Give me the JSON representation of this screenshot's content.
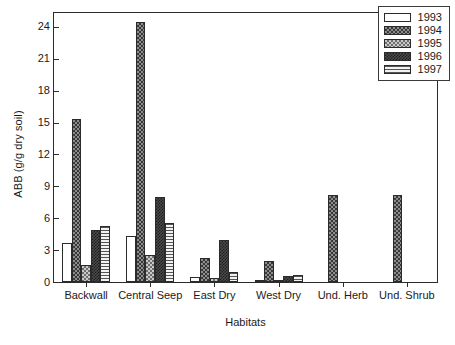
{
  "chart_data": {
    "type": "bar",
    "title": "",
    "xlabel": "Habitats",
    "ylabel": "ABB (g/g dry soil)",
    "categories": [
      "Backwall",
      "Central Seep",
      "East Dry",
      "West Dry",
      "Und. Herb",
      "Und. Shrub"
    ],
    "series": [
      {
        "name": "1993",
        "pattern": "empty",
        "values": [
          3.7,
          4.3,
          0.5,
          0.15,
          0,
          0
        ]
      },
      {
        "name": "1994",
        "pattern": "checkdark",
        "values": [
          15.3,
          24.5,
          2.3,
          2.0,
          8.2,
          8.2
        ]
      },
      {
        "name": "1995",
        "pattern": "checklight",
        "values": [
          1.6,
          2.5,
          0.4,
          0.15,
          0,
          0
        ]
      },
      {
        "name": "1996",
        "pattern": "solid",
        "values": [
          4.9,
          8.0,
          4.0,
          0.6,
          0,
          0
        ]
      },
      {
        "name": "1997",
        "pattern": "hlines",
        "values": [
          5.3,
          5.6,
          0.9,
          0.7,
          0,
          0
        ]
      }
    ],
    "ylim": [
      0,
      25.5
    ],
    "yticks": [
      0,
      3,
      6,
      9,
      12,
      15,
      18,
      21,
      24
    ],
    "ytick_labels": [
      "0",
      "3",
      "6",
      "9",
      "12",
      "15",
      "18",
      "21",
      "24"
    ],
    "grid": false,
    "legend_position": "top-right",
    "legend_entries": [
      "1993",
      "1994",
      "1995",
      "1996",
      "1997"
    ]
  }
}
